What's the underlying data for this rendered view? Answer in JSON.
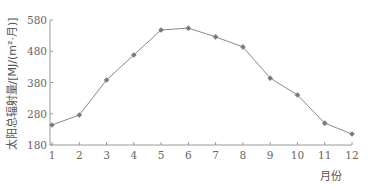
{
  "chart_data": {
    "type": "line",
    "title": "",
    "xlabel": "月份",
    "ylabel": "太阳总辐射量/[MJ/(m²·月)]",
    "categories": [
      "1",
      "2",
      "3",
      "4",
      "5",
      "6",
      "7",
      "8",
      "9",
      "10",
      "11",
      "12"
    ],
    "series": [
      {
        "name": "太阳总辐射量",
        "values": [
          244,
          276,
          388,
          468,
          548,
          554,
          526,
          494,
          394,
          340,
          250,
          215
        ]
      }
    ],
    "yticks": [
      180,
      280,
      380,
      480,
      580
    ],
    "ylim": [
      180,
      580
    ],
    "grid": false,
    "legend": "none",
    "colors": {
      "line": "#8a8a8a",
      "marker": "#7a7a7a",
      "axis": "#9a9a9a"
    }
  }
}
